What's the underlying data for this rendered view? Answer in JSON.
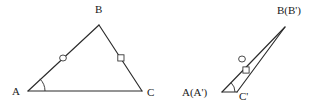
{
  "figure": {
    "background_color": "#ffffff",
    "stroke_color": "#2b2b2b",
    "label_color": "#1a1a1a",
    "width": 328,
    "height": 111
  },
  "left_figure": {
    "name": "triangle-abc",
    "vertices": [
      {
        "id": "A",
        "label": "A",
        "x": 28,
        "y": 91,
        "label_x": 12,
        "label_y": 95
      },
      {
        "id": "B",
        "label": "B",
        "x": 99,
        "y": 25,
        "label_x": 95,
        "label_y": 13
      },
      {
        "id": "C",
        "label": "C",
        "x": 142,
        "y": 91,
        "label_x": 147,
        "label_y": 96
      }
    ],
    "segments": [
      {
        "id": "AB",
        "from": "A",
        "to": "B"
      },
      {
        "id": "BC",
        "from": "B",
        "to": "C"
      },
      {
        "id": "AC",
        "from": "A",
        "to": "C"
      }
    ],
    "angle_marks": [
      {
        "id": "angle-A",
        "vertex": "A",
        "radius": 17
      }
    ],
    "tick_marks": [
      {
        "id": "tick-AB",
        "shape": "circle",
        "on_segment": "AB",
        "x": 63,
        "y": 58
      },
      {
        "id": "tick-BC",
        "shape": "square",
        "on_segment": "BC",
        "x": 121,
        "y": 58
      }
    ]
  },
  "right_figure": {
    "name": "triangle-abc-prime",
    "vertices": [
      {
        "id": "A",
        "label": "A(A')",
        "x": 222,
        "y": 92,
        "label_x": 182,
        "label_y": 96
      },
      {
        "id": "B",
        "label": "B(B')",
        "x": 285,
        "y": 27,
        "label_x": 277,
        "label_y": 14
      },
      {
        "id": "C",
        "label": "C'",
        "x": 237,
        "y": 92,
        "label_x": 239,
        "label_y": 100
      }
    ],
    "segments": [
      {
        "id": "AB",
        "from": "A",
        "to": "B"
      },
      {
        "id": "CB",
        "from": "C",
        "to": "B"
      },
      {
        "id": "AC",
        "from": "A",
        "to": "C"
      }
    ],
    "angle_marks": [
      {
        "id": "angle-A-prime",
        "vertex": "A",
        "radius": 13
      }
    ],
    "tick_marks": [
      {
        "id": "tick-AB-prime",
        "shape": "circle",
        "on_segment": "AB",
        "x": 242,
        "y": 59
      },
      {
        "id": "tick-CB-prime",
        "shape": "square",
        "on_segment": "CB",
        "x": 246,
        "y": 70
      }
    ]
  }
}
